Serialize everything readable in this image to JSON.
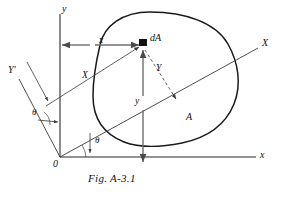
{
  "figure": {
    "caption": "Fig. A-3.1",
    "origin_label": "0",
    "axes": {
      "x_axis_label": "x",
      "y_axis_label": "y",
      "X_axis_label": "X",
      "Y_axis_label": "Y'"
    },
    "dimensions": {
      "x_distance_label": "x",
      "y_distance_label": "y",
      "X_distance_label": "X",
      "Y_distance_label": "Y"
    },
    "angles": {
      "theta_lower_label": "θ",
      "theta_upper_label": "θ"
    },
    "area": {
      "element_label": "dA",
      "region_label": "A"
    },
    "colors": {
      "stroke": "#1a1a1a",
      "thin_stroke": "#3a3a3a",
      "dim_stroke": "#6e6e6e",
      "background": "#ffffff"
    }
  }
}
